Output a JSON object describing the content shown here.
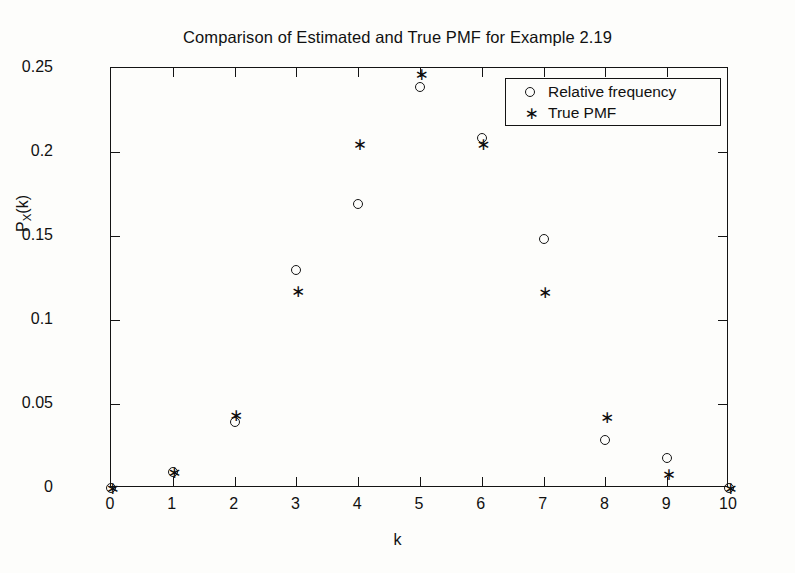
{
  "figure": {
    "background_color": "#fdfdfb",
    "foreground_color": "#141414"
  },
  "chart_data": {
    "type": "scatter",
    "title": "Comparison of Estimated and True PMF for Example 2.19",
    "xlabel": "k",
    "ylabel_prefix": "P",
    "ylabel_sub": "X",
    "ylabel_suffix": "(k)",
    "ylabel_plain": "P_X(k)",
    "xlim": [
      0,
      10
    ],
    "ylim": [
      0,
      0.25
    ],
    "grid": false,
    "legend_position": "upper right",
    "xticks": [
      0,
      1,
      2,
      3,
      4,
      5,
      6,
      7,
      8,
      9,
      10
    ],
    "xtick_labels": [
      "0",
      "1",
      "2",
      "3",
      "4",
      "5",
      "6",
      "7",
      "8",
      "9",
      "10"
    ],
    "yticks": [
      0,
      0.05,
      0.1,
      0.15,
      0.2,
      0.25
    ],
    "ytick_labels": [
      "0",
      "0.05",
      "0.1",
      "0.15",
      "0.2",
      "0.25"
    ],
    "x": [
      0,
      1,
      2,
      3,
      4,
      5,
      6,
      7,
      8,
      9,
      10
    ],
    "series": [
      {
        "name": "Relative frequency",
        "marker": "circle-marker",
        "marker_glyph": "○",
        "color": "#151515",
        "values": [
          0.0,
          0.0098,
          0.039,
          0.13,
          0.169,
          0.2385,
          0.2085,
          0.1485,
          0.0285,
          0.018,
          0.0
        ]
      },
      {
        "name": "True PMF",
        "marker": "asterisk-marker",
        "marker_glyph": "∗",
        "color": "#0d0d0d",
        "values": [
          0.0,
          0.0098,
          0.0435,
          0.117,
          0.2045,
          0.2465,
          0.2045,
          0.1165,
          0.0425,
          0.0085,
          0.0
        ]
      }
    ]
  }
}
